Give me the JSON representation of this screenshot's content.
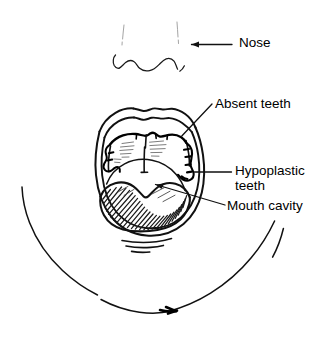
{
  "figure": {
    "type": "hand-drawn anatomical line diagram",
    "background_color": "#ffffff",
    "ink_color": "#000000"
  },
  "labels": {
    "nose": "Nose",
    "absent_teeth": "Absent teeth",
    "hypoplastic_teeth": "Hypoplastic teeth",
    "mouth_cavity": "Mouth cavity"
  },
  "annotations": [
    {
      "name": "nose-annotation",
      "text": "Nose",
      "leader": "horizontal arrow pointing left"
    },
    {
      "name": "absent-teeth-annotation",
      "text": "Absent teeth",
      "leader": "diagonal line down-left to upper gum ridge"
    },
    {
      "name": "hypoplastic-teeth-annotation",
      "text": "Hypoplastic teeth",
      "leader": "horizontal line left to right molar area"
    },
    {
      "name": "mouth-cavity-annotation",
      "text": "Mouth cavity",
      "leader": "diagonal arrow up-left into the oral cavity"
    }
  ],
  "drawing_parts": [
    "nose-nostrils",
    "lips-outer-outline",
    "lips-inner-outline",
    "hard-palate",
    "upper-gum-ridge",
    "teeth-remnants-left",
    "teeth-remnants-right",
    "tongue",
    "tongue-hatching",
    "chin-crease",
    "jaw-outline"
  ]
}
